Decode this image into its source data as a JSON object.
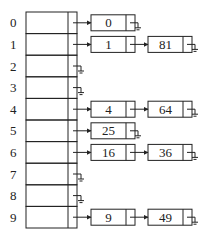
{
  "diagram": {
    "type": "hash-table-separate-chaining",
    "buckets": [
      {
        "index": "0",
        "chain": [
          "0"
        ]
      },
      {
        "index": "1",
        "chain": [
          "1",
          "81"
        ]
      },
      {
        "index": "2",
        "chain": []
      },
      {
        "index": "3",
        "chain": []
      },
      {
        "index": "4",
        "chain": [
          "4",
          "64"
        ]
      },
      {
        "index": "5",
        "chain": [
          "25"
        ]
      },
      {
        "index": "6",
        "chain": [
          "16",
          "36"
        ]
      },
      {
        "index": "7",
        "chain": []
      },
      {
        "index": "8",
        "chain": []
      },
      {
        "index": "9",
        "chain": [
          "9",
          "49"
        ]
      }
    ],
    "null_symbol": "ground-icon",
    "colors": {
      "line": "#222222",
      "background": "#ffffff"
    }
  }
}
